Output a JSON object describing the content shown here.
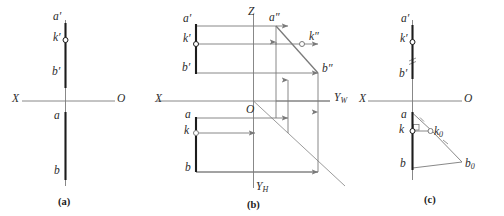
{
  "figure": {
    "type": "descriptive-geometry-projection",
    "panels": [
      {
        "id": "a",
        "caption": "(a)",
        "axis": {
          "left_label": "X",
          "right_label": "O"
        },
        "labels": [
          {
            "name": "a-prime",
            "text": "a′"
          },
          {
            "name": "k-prime",
            "text": "k′"
          },
          {
            "name": "b-prime",
            "text": "b′"
          },
          {
            "name": "a",
            "text": "a"
          },
          {
            "name": "b",
            "text": "b"
          }
        ]
      },
      {
        "id": "b",
        "caption": "(b)",
        "axis": {
          "left_label": "X",
          "z_label": "Z",
          "yw_main": "Y",
          "yw_sub": "W",
          "yh_main": "Y",
          "yh_sub": "H",
          "origin_label": "O"
        },
        "labels": [
          {
            "name": "a-prime",
            "text": "a′"
          },
          {
            "name": "k-prime",
            "text": "k′"
          },
          {
            "name": "b-prime",
            "text": "b′"
          },
          {
            "name": "a",
            "text": "a"
          },
          {
            "name": "k",
            "text": "k"
          },
          {
            "name": "b",
            "text": "b"
          },
          {
            "name": "a-double-prime",
            "text": "a″"
          },
          {
            "name": "k-double-prime",
            "text": "k″"
          },
          {
            "name": "b-double-prime",
            "text": "b″"
          }
        ]
      },
      {
        "id": "c",
        "caption": "(c)",
        "axis": {
          "left_label": "X",
          "right_label": "O"
        },
        "labels": [
          {
            "name": "a-prime",
            "text": "a′"
          },
          {
            "name": "k-prime",
            "text": "k′"
          },
          {
            "name": "b-prime",
            "text": "b′"
          },
          {
            "name": "a",
            "text": "a"
          },
          {
            "name": "k",
            "text": "k"
          },
          {
            "name": "b",
            "text": "b"
          },
          {
            "name": "k-zero-main",
            "text": "k"
          },
          {
            "name": "k-zero-sub",
            "text": "0"
          },
          {
            "name": "b-zero-main",
            "text": "b"
          },
          {
            "name": "b-zero-sub",
            "text": "0"
          }
        ]
      }
    ],
    "colors": {
      "line": "#7a7a7a",
      "bold_line": "#1c1c1c",
      "text": "#2b2b2b",
      "caption": "#1a1a1a",
      "background": "#ffffff"
    }
  }
}
